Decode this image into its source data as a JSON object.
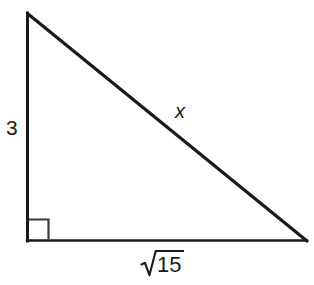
{
  "figure": {
    "kind": "right-triangle-diagram",
    "background_color": "#ffffff",
    "stroke_color": "#1a1a1a",
    "alt": "Right triangle with vertical leg 3, horizontal leg square root of 15, and hypotenuse x"
  },
  "geometry": {
    "apex": {
      "x": 27,
      "y": 13
    },
    "right_angle_vertex": {
      "x": 27,
      "y": 241
    },
    "base_right_vertex": {
      "x": 307,
      "y": 241
    },
    "right_angle_marker": {
      "size": 20,
      "x": 29,
      "y": 219,
      "present": true
    }
  },
  "labels": {
    "vertical_leg": "3",
    "hypotenuse": "x",
    "base_leg_radical_symbol": "√",
    "base_leg_radicand": "15",
    "base_leg_full": "√15"
  },
  "icons": {
    "right_angle_marker": "right-angle-square-icon",
    "radical": "radical-sign-icon"
  }
}
